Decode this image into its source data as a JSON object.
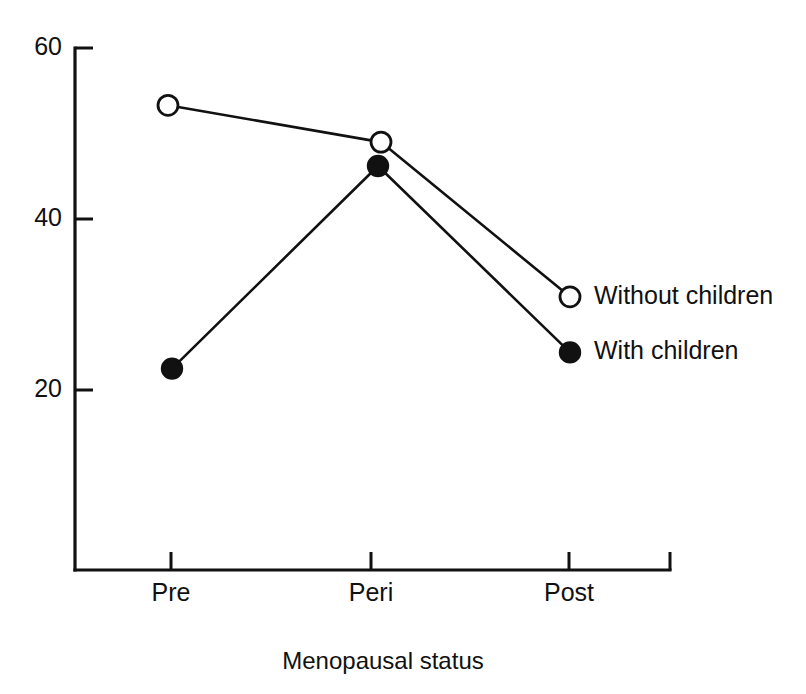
{
  "chart_data": {
    "type": "line",
    "title": "",
    "subtitle": "",
    "xlabel": "Menopausal status",
    "ylabel": "",
    "categories": [
      "Pre",
      "Peri",
      "Post"
    ],
    "series": [
      {
        "name": "Without children",
        "marker": "open-circle",
        "values": [
          53.3,
          49.0,
          30.9
        ]
      },
      {
        "name": "With children",
        "marker": "filled-circle",
        "values": [
          22.5,
          46.2,
          24.4
        ]
      }
    ],
    "y_ticks": [
      20,
      40,
      60
    ],
    "y_tick_labels": [
      "20",
      "40",
      "60"
    ],
    "ylim": [
      4,
      60
    ],
    "x_tick_labels": [
      "Pre",
      "Peri",
      "Post"
    ],
    "grid": false,
    "legend_position": "right-of-last-point",
    "legend_entries": [
      "Without children",
      "With children"
    ],
    "colors": {
      "line": "#111111",
      "marker_open_fill": "#ffffff",
      "marker_filled_fill": "#111111",
      "background": "#ffffff",
      "text": "#111111"
    }
  }
}
